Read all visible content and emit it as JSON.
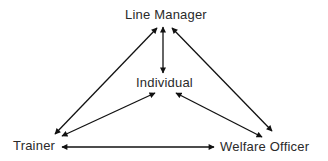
{
  "diagram": {
    "type": "relationship-triangle",
    "nodes": [
      {
        "id": "line_manager",
        "label": "Line Manager"
      },
      {
        "id": "individual",
        "label": "Individual"
      },
      {
        "id": "trainer",
        "label": "Trainer"
      },
      {
        "id": "welfare_officer",
        "label": "Welfare Officer"
      }
    ],
    "edges": [
      {
        "from": "line_manager",
        "to": "individual",
        "direction": "both"
      },
      {
        "from": "line_manager",
        "to": "trainer",
        "direction": "both"
      },
      {
        "from": "line_manager",
        "to": "welfare_officer",
        "direction": "both"
      },
      {
        "from": "individual",
        "to": "trainer",
        "direction": "both"
      },
      {
        "from": "individual",
        "to": "welfare_officer",
        "direction": "both"
      },
      {
        "from": "trainer",
        "to": "welfare_officer",
        "direction": "both"
      }
    ],
    "colors": {
      "line": "#111111",
      "text": "#2a2a2a",
      "background": "#ffffff"
    }
  }
}
